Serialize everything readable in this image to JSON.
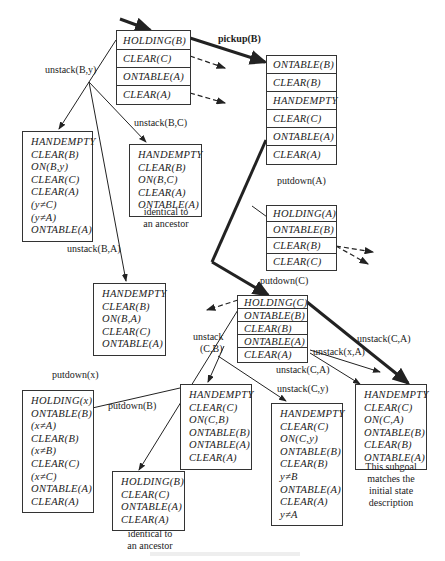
{
  "nodes": {
    "root": {
      "items": [
        "HOLDING(B)",
        "CLEAR(C)",
        "ONTABLE(A)",
        "CLEAR(A)"
      ]
    },
    "n_pickup": {
      "items": [
        "ONTABLE(B)",
        "CLEAR(B)",
        "HANDEMPTY",
        "CLEAR(C)",
        "ONTABLE(A)",
        "CLEAR(A)"
      ]
    },
    "n_unstack_By": {
      "items": [
        "HANDEMPTY",
        "CLEAR(B)",
        "ON(B,y)",
        "CLEAR(C)",
        "CLEAR(A)",
        "(y≠C)",
        "(y≠A)",
        "ONTABLE(A)"
      ]
    },
    "n_unstack_BC": {
      "items": [
        "HANDEMPTY",
        "CLEAR(B)",
        "ON(B,C)",
        "CLEAR(A)",
        "ONTABLE(A)"
      ],
      "note": "identical to an ancestor"
    },
    "n_unstack_BA": {
      "items": [
        "HANDEMPTY",
        "CLEAR(B)",
        "ON(B,A)",
        "CLEAR(C)",
        "ONTABLE(A)"
      ]
    },
    "n_putdown_A": {
      "items": [
        "HOLDING(A)",
        "ONTABLE(B)",
        "CLEAR(B)",
        "CLEAR(C)"
      ]
    },
    "n_putdown_C": {
      "items": [
        "HOLDING(C)",
        "ONTABLE(B)",
        "CLEAR(B)",
        "ONTABLE(A)",
        "CLEAR(A)"
      ]
    },
    "n_putdown_x": {
      "items": [
        "HOLDING(x)",
        "ONTABLE(B)",
        "(x≠A)",
        "CLEAR(B)",
        "(x≠B)",
        "CLEAR(C)",
        "(x≠C)",
        "ONTABLE(A)",
        "CLEAR(A)"
      ]
    },
    "n_putdown_B": {
      "items": [
        "HOLDING(B)",
        "CLEAR(C)",
        "ONTABLE(A)",
        "CLEAR(A)"
      ],
      "note": "identical to an ancestor"
    },
    "n_unstack_CB": {
      "items": [
        "HANDEMPTY",
        "CLEAR(C)",
        "ON(C,B)",
        "ONTABLE(B)",
        "ONTABLE(A)",
        "CLEAR(A)"
      ]
    },
    "n_unstack_Cy": {
      "items": [
        "HANDEMPTY",
        "CLEAR(C)",
        "ON(C,y)",
        "ONTABLE(B)",
        "CLEAR(B)",
        "y≠B",
        "ONTABLE(A)",
        "CLEAR(A)",
        "y≠A"
      ]
    },
    "n_unstack_CA": {
      "items": [
        "HANDEMPTY",
        "CLEAR(C)",
        "ON(C,A)",
        "ONTABLE(B)",
        "CLEAR(B)",
        "ONTABLE(A)"
      ],
      "note": "This subgoal matches the initial state description"
    }
  },
  "edge_labels": {
    "pickup_B": "pickup(B)",
    "unstack_By": "unstack(B,y)",
    "unstack_BC": "unstack(B,C)",
    "unstack_BA": "unstack(B,A)",
    "putdown_A": "putdown(A)",
    "putdown_C": "putdown(C)",
    "unstack_CA_bold": "unstack(C,A)",
    "unstack_xA": "unstack(x,A)",
    "unstack_CA": "unstack(C,A)",
    "unstack_CB_1": "unstack",
    "unstack_CB_2": "(C,B)",
    "unstack_Cy": "unstack(C,y)",
    "putdown_x": "putdown(x)",
    "putdown_B": "putdown(B)"
  }
}
